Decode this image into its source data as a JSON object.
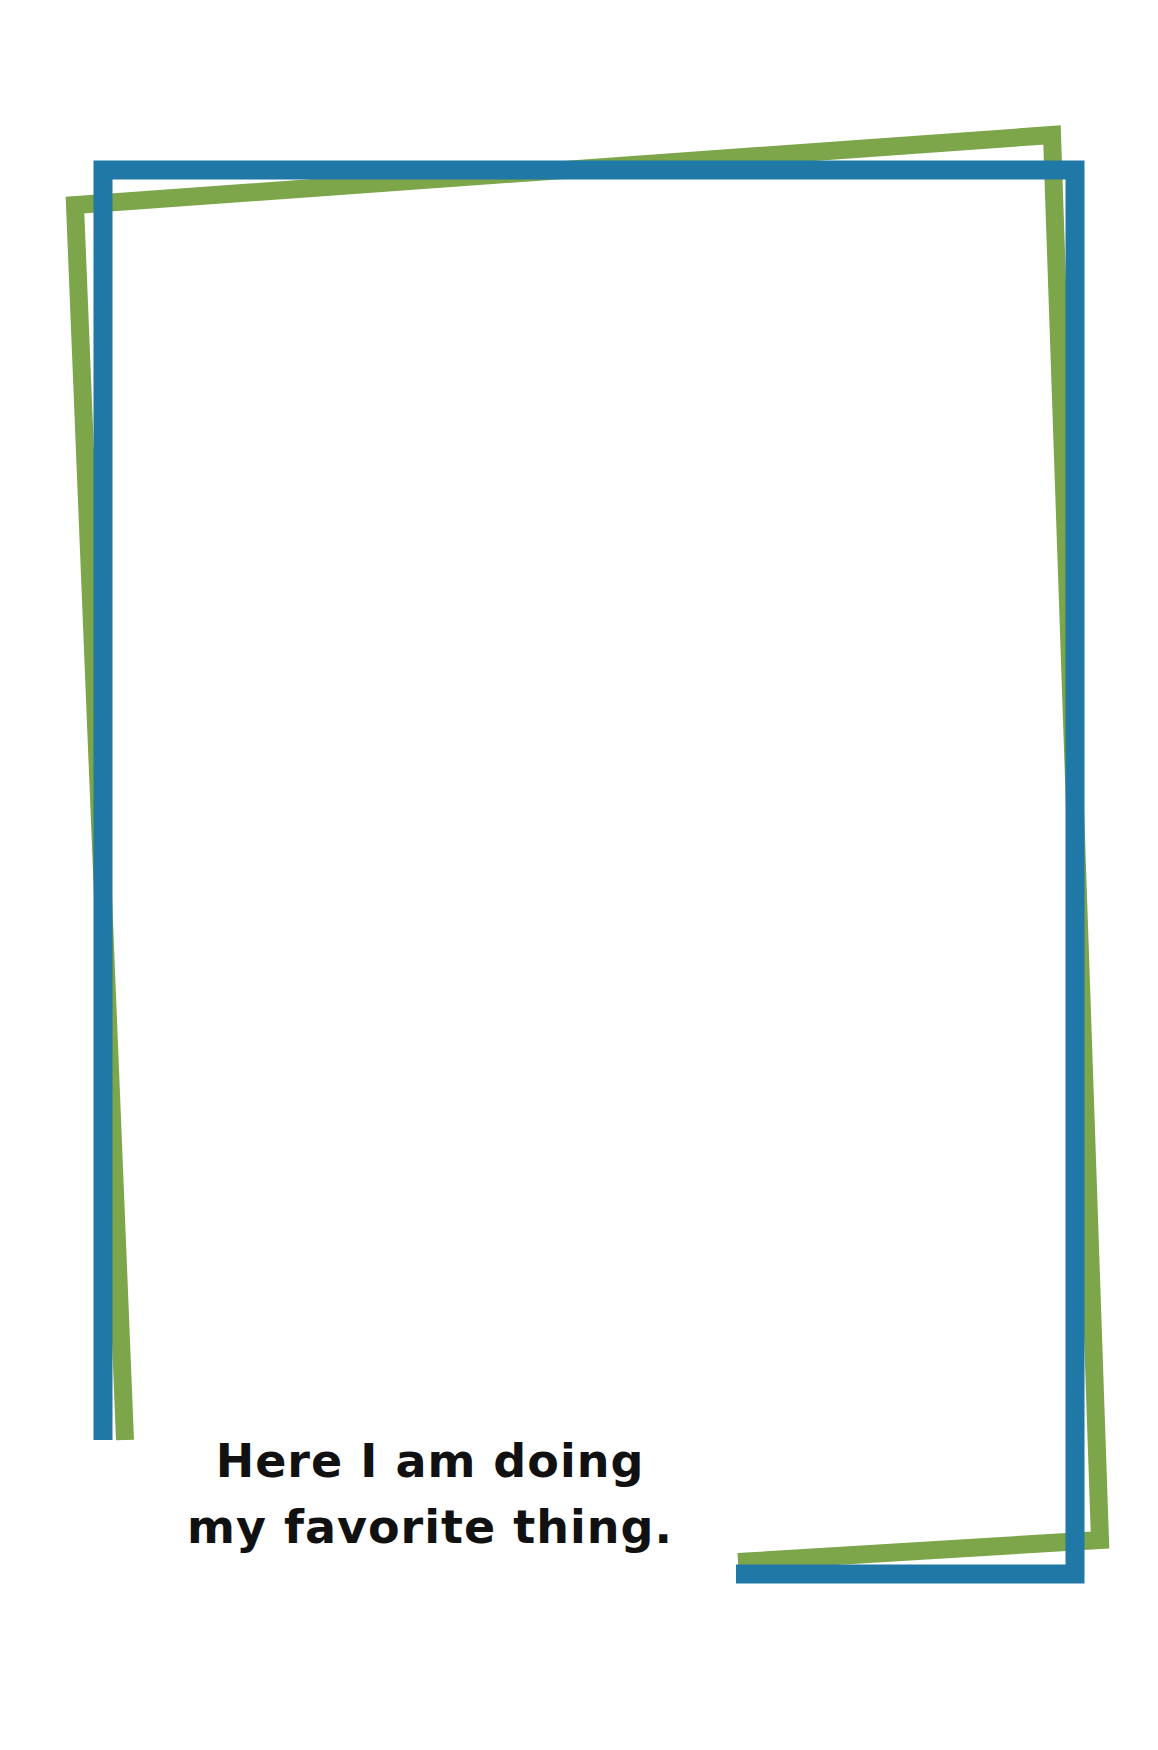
{
  "caption": {
    "line1": "Here I am doing",
    "line2": "my favorite thing."
  },
  "colors": {
    "blue_frame": "#1f78a6",
    "green_frame": "#7da54a",
    "text": "#111111",
    "background": "#ffffff"
  }
}
